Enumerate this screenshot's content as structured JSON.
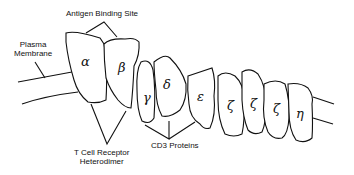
{
  "diagram": {
    "labels": {
      "antigen_binding_site": "Antigen Binding Site",
      "plasma_membrane_line1": "Plasma",
      "plasma_membrane_line2": "Membrane",
      "tcr_line1": "T Cell Receptor",
      "tcr_line2": "Heterodimer",
      "cd3": "CD3 Proteins"
    },
    "subunits": [
      {
        "symbol": "α",
        "group": "T Cell Receptor Heterodimer"
      },
      {
        "symbol": "β",
        "group": "T Cell Receptor Heterodimer"
      },
      {
        "symbol": "γ",
        "group": "CD3 Proteins"
      },
      {
        "symbol": "δ",
        "group": "CD3 Proteins"
      },
      {
        "symbol": "ε",
        "group": "CD3 Proteins"
      },
      {
        "symbol": "ζ",
        "group": ""
      },
      {
        "symbol": "ζ",
        "group": ""
      },
      {
        "symbol": "ζ",
        "group": ""
      },
      {
        "symbol": "η",
        "group": ""
      }
    ]
  }
}
